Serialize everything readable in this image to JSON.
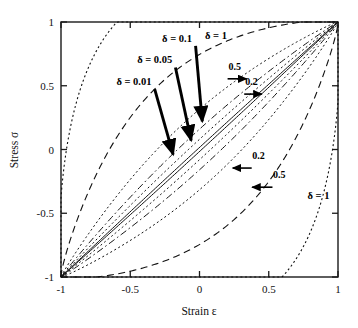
{
  "chart_data": {
    "type": "line",
    "title": "",
    "xlabel": "Strain ε",
    "ylabel": "Stress σ",
    "xlim": [
      -1,
      1
    ],
    "ylim": [
      -1,
      1
    ],
    "xticks": [
      -1,
      -0.5,
      0,
      0.5,
      1
    ],
    "yticks": [
      -1,
      -0.5,
      0,
      0.5,
      1
    ],
    "xtick_labels": [
      "-1",
      "-0.5",
      "0",
      "0.5",
      "1"
    ],
    "ytick_labels": [
      "-1",
      "-0.5",
      "0",
      "0.5",
      "1"
    ],
    "grid": false,
    "legend_position": "none",
    "series": [
      {
        "name": "δ = 0.01",
        "delta": 0.01,
        "width": 0.01,
        "linestyle": "solid",
        "endpoints": [
          [
            -1,
            -1
          ],
          [
            1,
            1
          ]
        ]
      },
      {
        "name": "δ = 0.05",
        "delta": 0.05,
        "width": 0.05,
        "linestyle": "dotted",
        "endpoints": [
          [
            -1,
            -1
          ],
          [
            1,
            1
          ]
        ]
      },
      {
        "name": "δ = 0.1",
        "delta": 0.1,
        "width": 0.1,
        "linestyle": "dash-dot",
        "endpoints": [
          [
            -1,
            -1
          ],
          [
            1,
            1
          ]
        ]
      },
      {
        "name": "0.2",
        "delta": 0.2,
        "width": 0.2,
        "linestyle": "dotted",
        "endpoints": [
          [
            -1,
            -1
          ],
          [
            1,
            1
          ]
        ]
      },
      {
        "name": "0.5",
        "delta": 0.5,
        "width": 0.5,
        "linestyle": "dashed",
        "endpoints": [
          [
            -1,
            -1
          ],
          [
            1,
            1
          ]
        ]
      },
      {
        "name": "δ = 1",
        "delta": 1.0,
        "width": 1.0,
        "linestyle": "dotted",
        "endpoints": [
          [
            -1,
            -1
          ],
          [
            1,
            1
          ]
        ]
      }
    ],
    "annotations": [
      {
        "id": "label-delta-0p1",
        "text": "δ = 0.1",
        "x": -0.27,
        "y": 0.845,
        "arrow": "down-right",
        "points_to": [
          0.02,
          0.22
        ]
      },
      {
        "id": "label-delta-0p05",
        "text": "δ = 0.05",
        "x": -0.45,
        "y": 0.675,
        "arrow": "down-right",
        "points_to": [
          -0.06,
          0.07
        ]
      },
      {
        "id": "label-delta-0p01",
        "text": "δ = 0.01",
        "x": -0.6,
        "y": 0.505,
        "arrow": "down-right",
        "points_to": [
          -0.19,
          -0.04
        ]
      },
      {
        "id": "label-delta-1-top",
        "text": "δ = 1",
        "x": 0.04,
        "y": 0.865,
        "arrow": "none",
        "points_to": null
      },
      {
        "id": "label-0p5-upper",
        "text": "0.5",
        "x": 0.21,
        "y": 0.625,
        "arrow": "right",
        "points_to": [
          0.34,
          0.555
        ]
      },
      {
        "id": "label-0p2-upper",
        "text": "0.2",
        "x": 0.33,
        "y": 0.505,
        "arrow": "right",
        "points_to": [
          0.45,
          0.435
        ]
      },
      {
        "id": "label-0p2-lower",
        "text": "0.2",
        "x": 0.38,
        "y": -0.075,
        "arrow": "left",
        "points_to": [
          0.24,
          -0.135
        ]
      },
      {
        "id": "label-0p5-lower",
        "text": "0.5",
        "x": 0.53,
        "y": -0.225,
        "arrow": "left",
        "points_to": [
          0.38,
          -0.295
        ]
      },
      {
        "id": "label-delta-1-bottom",
        "text": "δ = 1",
        "x": 0.78,
        "y": -0.385,
        "arrow": "none",
        "points_to": null
      }
    ]
  },
  "colors": {
    "axis": "#1a1a1a",
    "curve": "#111111",
    "annotation": "#000000",
    "background": "#ffffff"
  }
}
